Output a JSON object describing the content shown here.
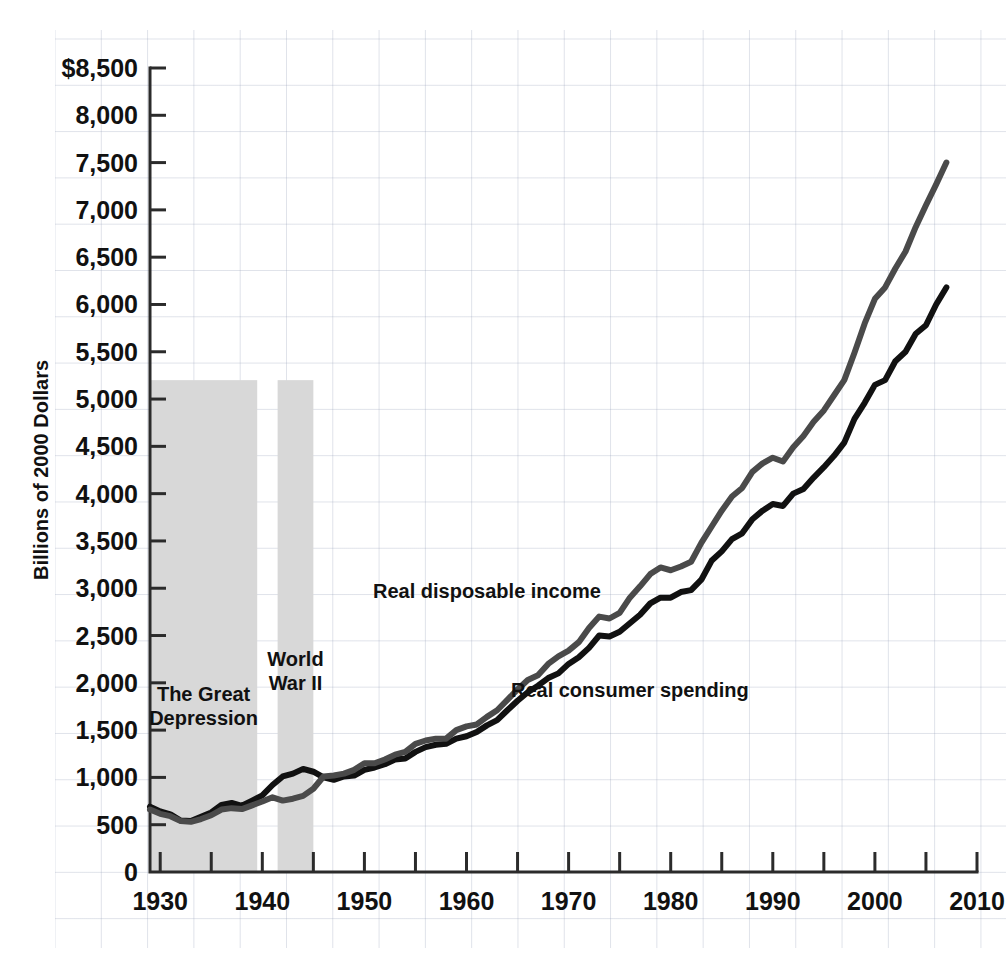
{
  "chart_data": {
    "type": "line",
    "title": "",
    "xlabel": "",
    "ylabel": "Billions of 2000 Dollars",
    "xlim": [
      1929,
      2010
    ],
    "ylim": [
      0,
      8500
    ],
    "grid": true,
    "legend_position": "inline-annotations",
    "y_ticks": [
      0,
      500,
      1000,
      1500,
      2000,
      2500,
      3000,
      3500,
      4000,
      4500,
      5000,
      5500,
      6000,
      6500,
      7000,
      7500,
      8000,
      8500
    ],
    "y_tick_labels": [
      "0",
      "500",
      "1,000",
      "1,500",
      "2,000",
      "2,500",
      "3,000",
      "3,500",
      "4,000",
      "4,500",
      "5,000",
      "5,500",
      "6,000",
      "6,500",
      "7,000",
      "7,500",
      "8,000",
      "$8,500"
    ],
    "x_ticks": [
      1930,
      1935,
      1940,
      1945,
      1950,
      1955,
      1960,
      1965,
      1970,
      1975,
      1980,
      1985,
      1990,
      1995,
      2000,
      2005,
      2010
    ],
    "x_tick_labels": [
      "1930",
      "",
      "1940",
      "",
      "1950",
      "",
      "1960",
      "",
      "1970",
      "",
      "1980",
      "",
      "1990",
      "",
      "2000",
      "",
      "2010"
    ],
    "x": [
      1929,
      1930,
      1931,
      1932,
      1933,
      1934,
      1935,
      1936,
      1937,
      1938,
      1939,
      1940,
      1941,
      1942,
      1943,
      1944,
      1945,
      1946,
      1947,
      1948,
      1949,
      1950,
      1951,
      1952,
      1953,
      1954,
      1955,
      1956,
      1957,
      1958,
      1959,
      1960,
      1961,
      1962,
      1963,
      1964,
      1965,
      1966,
      1967,
      1968,
      1969,
      1970,
      1971,
      1972,
      1973,
      1974,
      1975,
      1976,
      1977,
      1978,
      1979,
      1980,
      1981,
      1982,
      1983,
      1984,
      1985,
      1986,
      1987,
      1988,
      1989,
      1990,
      1991,
      1992,
      1993,
      1994,
      1995,
      1996,
      1997,
      1998,
      1999,
      2000,
      2001,
      2002,
      2003,
      2004,
      2005,
      2006,
      2007
    ],
    "series": [
      {
        "name": "Real disposable income",
        "color": "#111111",
        "label_x": 1962,
        "label_y": 2900,
        "values": [
          690,
          640,
          610,
          545,
          540,
          585,
          630,
          710,
          730,
          700,
          755,
          810,
          920,
          1010,
          1040,
          1090,
          1060,
          1000,
          975,
          1010,
          1020,
          1080,
          1105,
          1140,
          1190,
          1200,
          1270,
          1320,
          1345,
          1355,
          1410,
          1435,
          1480,
          1550,
          1605,
          1710,
          1810,
          1900,
          1970,
          2050,
          2100,
          2200,
          2270,
          2370,
          2500,
          2490,
          2540,
          2630,
          2720,
          2840,
          2900,
          2900,
          2960,
          2980,
          3090,
          3290,
          3390,
          3520,
          3580,
          3730,
          3820,
          3890,
          3870,
          4000,
          4050,
          4170,
          4280,
          4400,
          4540,
          4790,
          4960,
          5150,
          5200,
          5400,
          5500,
          5690,
          5780,
          6000,
          6180
        ]
      },
      {
        "name": "Real consumer spending",
        "color": "#4a4a4a",
        "label_x": 1976,
        "label_y": 1850,
        "values": [
          660,
          615,
          590,
          540,
          530,
          560,
          600,
          660,
          675,
          665,
          705,
          745,
          790,
          755,
          775,
          805,
          880,
          1010,
          1020,
          1040,
          1080,
          1150,
          1150,
          1190,
          1240,
          1270,
          1355,
          1390,
          1410,
          1410,
          1500,
          1540,
          1560,
          1640,
          1710,
          1820,
          1930,
          2030,
          2080,
          2200,
          2280,
          2340,
          2430,
          2580,
          2700,
          2680,
          2740,
          2900,
          3020,
          3150,
          3220,
          3190,
          3230,
          3280,
          3480,
          3650,
          3820,
          3970,
          4060,
          4230,
          4320,
          4380,
          4340,
          4490,
          4610,
          4760,
          4880,
          5040,
          5200,
          5490,
          5800,
          6060,
          6180,
          6380,
          6560,
          6820,
          7050,
          7270,
          7500
        ]
      }
    ],
    "shaded_regions": [
      {
        "name": "The Great Depression",
        "start": 1929,
        "end": 1939.5,
        "label": "The Great\nDepression",
        "label_lines": [
          "The Great",
          "Depression"
        ],
        "top_value": 5200,
        "color": "#d8d8d8"
      },
      {
        "name": "World War II",
        "start": 1941.5,
        "end": 1945.0,
        "label": "World\nWar II",
        "label_lines": [
          "World",
          "War II"
        ],
        "top_value": 5200,
        "color": "#d8d8d8"
      }
    ]
  },
  "annotations": {
    "great_depression_line1": "The Great",
    "great_depression_line2": "Depression",
    "world_war_line1": "World",
    "world_war_line2": "War II",
    "series_income": "Real disposable income",
    "series_spending": "Real consumer spending",
    "y_axis_title": "Billions of 2000 Dollars"
  }
}
